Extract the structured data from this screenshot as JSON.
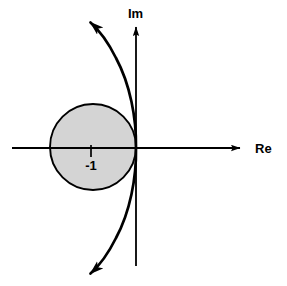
{
  "figure": {
    "title": "",
    "background_color": "#ffffff",
    "width": 287,
    "height": 286
  },
  "axes": {
    "real": {
      "label": "Re",
      "label_name": "real-axis-label",
      "orientation": "horizontal",
      "arrow": "right"
    },
    "imaginary": {
      "label": "Im",
      "label_name": "imaginary-axis-label",
      "orientation": "vertical",
      "arrow": "up"
    }
  },
  "annotations": {
    "center_tick_label": "-1"
  },
  "chart_data": {
    "type": "scatter",
    "title": "",
    "subtitle": "",
    "xlabel": "Re",
    "ylabel": "Im",
    "plane": "complex",
    "grid": false,
    "legend": null,
    "xlim": [
      -2.9,
      2.5
    ],
    "ylim": [
      -2.7,
      2.9
    ],
    "origin_px": [
      136,
      148
    ],
    "units_per_px": 0.0233,
    "shapes": [
      {
        "name": "stability-disk",
        "type": "circle",
        "center": [
          -1,
          0
        ],
        "radius": 1,
        "center_px": [
          93,
          147
        ],
        "radius_px": 43,
        "fill": "#d4d4d4",
        "fill_opacity": 1,
        "stroke": "#000000",
        "stroke_width": 1.8,
        "description": "Shaded unit disk centered at -1 in the complex plane"
      },
      {
        "name": "stability-boundary-curve",
        "type": "open-curve",
        "stroke": "#000000",
        "stroke_width": 2.6,
        "fill": "none",
        "arrow_start": "down-left",
        "arrow_end": "up-left",
        "tangent_to": "imaginary-axis-at-origin",
        "passes_through_px": [
          [
            85,
            22
          ],
          [
            104,
            52
          ],
          [
            118,
            80
          ],
          [
            128,
            108
          ],
          [
            134,
            131
          ],
          [
            136,
            148
          ],
          [
            134,
            168
          ],
          [
            128,
            196
          ],
          [
            117,
            226
          ],
          [
            100,
            256
          ],
          [
            85,
            268
          ]
        ],
        "description": "Curve tangent to the imaginary axis at the origin, bending left into the second and third quadrants, with arrowheads at both ends"
      },
      {
        "name": "center-tick-mark",
        "type": "tick",
        "at": [
          -1,
          0
        ],
        "at_px": [
          91,
          148
        ],
        "length_px": 12,
        "orientation": "vertical-below-axis",
        "stroke": "#000000"
      }
    ],
    "axis_lines": [
      {
        "name": "real-axis",
        "from_px": [
          12,
          148
        ],
        "to_px": [
          247,
          148
        ],
        "arrow_end": true,
        "stroke": "#000000",
        "stroke_width": 1.8
      },
      {
        "name": "imaginary-axis",
        "from_px": [
          136,
          266
        ],
        "to_px": [
          136,
          20
        ],
        "arrow_end": true,
        "stroke": "#000000",
        "stroke_width": 1.8
      }
    ]
  }
}
